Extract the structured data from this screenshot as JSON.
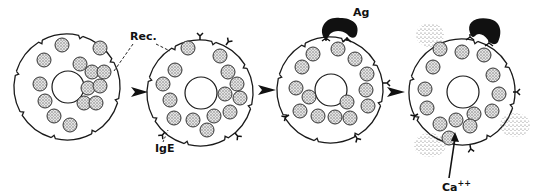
{
  "figure": {
    "stages": [
      {
        "id": "resting",
        "granule_count": 13
      },
      {
        "id": "ige-bound",
        "granule_count": 14
      },
      {
        "id": "antigen-bound",
        "granule_count": 15
      },
      {
        "id": "degranulating",
        "granule_count": 14
      }
    ],
    "labels": {
      "receptor": "Rec.",
      "ige": "IgE",
      "antigen": "Ag",
      "calcium": "Ca",
      "calcium_charge": "++"
    },
    "colors": {
      "line": "#1a1a1a",
      "granule_stipple": "#8a8a8a",
      "background": "#ffffff"
    }
  }
}
